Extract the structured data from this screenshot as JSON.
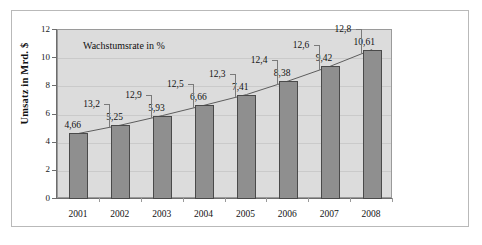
{
  "chart_data": {
    "type": "bar",
    "title": "",
    "subtitle": "",
    "xlabel": "",
    "ylabel": "Umsatz in Mrd. $",
    "ylim": [
      0,
      12
    ],
    "yticks": [
      0,
      2,
      4,
      6,
      8,
      10,
      12
    ],
    "ytick_labels": [
      "0",
      "2",
      "4",
      "6",
      "8",
      "10",
      "12"
    ],
    "grid": true,
    "legend": "none",
    "annotation": "Wachstumsrate in %",
    "categories": [
      "2001",
      "2002",
      "2003",
      "2004",
      "2005",
      "2006",
      "2007",
      "2008"
    ],
    "values": [
      4.66,
      5.25,
      5.93,
      6.66,
      7.41,
      8.38,
      9.42,
      10.61
    ],
    "value_labels": [
      "4,66",
      "5,25",
      "5,93",
      "6,66",
      "7,41",
      "8,38",
      "9,42",
      "10,61"
    ],
    "series": [
      {
        "name": "Umsatz in Mrd. $",
        "values": [
          4.66,
          5.25,
          5.93,
          6.66,
          7.41,
          8.38,
          9.42,
          10.61
        ]
      },
      {
        "name": "Wachstumsrate in %",
        "values": [
          13.2,
          12.9,
          12.5,
          12.3,
          12.4,
          12.6,
          12.8,
          null
        ],
        "labels": [
          "13,2",
          "12,9",
          "12,5",
          "12,3",
          "12,4",
          "12,6",
          "12,8",
          ""
        ]
      }
    ],
    "growth_labels": [
      "13,2",
      "12,9",
      "12,5",
      "12,3",
      "12,4",
      "12,6",
      "12,8"
    ],
    "growth_values": [
      13.2,
      12.9,
      12.5,
      12.3,
      12.4,
      12.6,
      12.8
    ],
    "colors": {
      "bar_fill": "#8f8f8f",
      "bar_border": "#4a4a4a",
      "plot_background": "#dcdcdc",
      "figure_background": "#ffffff",
      "axis": "#6d6d6d",
      "gridline": "#cacaca",
      "text": "#121212",
      "frame": "#b9b9b9",
      "leader_line": "#7a7a7a"
    }
  },
  "axis": {
    "y_title": "Umsatz in Mrd. $",
    "tick_0": "0",
    "tick_2": "2",
    "tick_4": "4",
    "tick_6": "6",
    "tick_8": "8",
    "tick_10": "10",
    "tick_12": "12"
  },
  "note": {
    "text": "Wachstumsrate in %"
  }
}
